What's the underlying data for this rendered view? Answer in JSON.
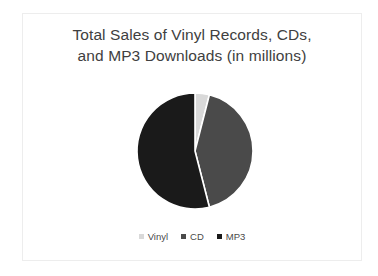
{
  "slide": {
    "background_color": "#ffffff",
    "frame_color": "#ededed"
  },
  "chart_data": {
    "type": "pie",
    "title": "Total Sales of Vinyl Records, CDs, and MP3 Downloads (in millions)",
    "title_lines": [
      "Total Sales of Vinyl Records, CDs,",
      "and MP3 Downloads (in millions)"
    ],
    "categories": [
      "Vinyl",
      "CD",
      "MP3"
    ],
    "values": [
      4,
      42,
      54
    ],
    "units": "millions",
    "start_angle_deg": 0,
    "direction": "clockwise",
    "colors": [
      "#d9d9d9",
      "#4a4a4a",
      "#1a1a1a"
    ],
    "legend": {
      "position": "bottom",
      "entries": [
        {
          "label": "Vinyl",
          "color": "#d9d9d9"
        },
        {
          "label": "CD",
          "color": "#4a4a4a"
        },
        {
          "label": "MP3",
          "color": "#1a1a1a"
        }
      ]
    },
    "data_labels": false,
    "grid": false,
    "xlabel": "",
    "ylabel": ""
  }
}
